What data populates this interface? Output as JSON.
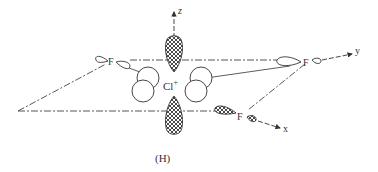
{
  "figure": {
    "caption": "(H)",
    "central_atom": {
      "symbol": "Cl",
      "charge": "+"
    },
    "ligands": [
      {
        "symbol": "F",
        "position": "left-back"
      },
      {
        "symbol": "F",
        "position": "right"
      },
      {
        "symbol": "F",
        "position": "front"
      }
    ],
    "axes": {
      "z": "z",
      "y": "y",
      "x": "x"
    },
    "colors": {
      "ink": "#333333",
      "background": "#ffffff"
    }
  }
}
